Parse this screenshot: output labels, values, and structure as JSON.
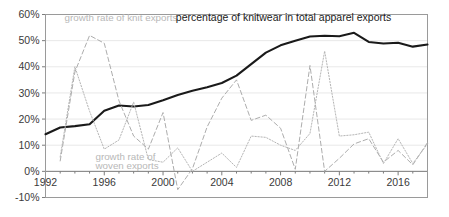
{
  "chart_data": {
    "type": "line",
    "title": "percentage of knitwear in total apparel exports",
    "xlabel": "",
    "ylabel": "",
    "xlim": [
      1992,
      2018
    ],
    "ylim": [
      -10,
      60
    ],
    "grid": true,
    "legend": "inline-annotations",
    "y_ticks": [
      "-10%",
      "0%",
      "10%",
      "20%",
      "30%",
      "40%",
      "50%",
      "60%"
    ],
    "y_tick_values": [
      -10,
      0,
      10,
      20,
      30,
      40,
      50,
      60
    ],
    "x_ticks": [
      "1992",
      "1996",
      "2000",
      "2004",
      "2008",
      "2012",
      "2016"
    ],
    "x_tick_values": [
      1992,
      1996,
      2000,
      2004,
      2008,
      2012,
      2016
    ],
    "x": [
      1992,
      1993,
      1994,
      1995,
      1996,
      1997,
      1998,
      1999,
      2000,
      2001,
      2002,
      2003,
      2004,
      2005,
      2006,
      2007,
      2008,
      2009,
      2010,
      2011,
      2012,
      2013,
      2014,
      2015,
      2016,
      2017,
      2018
    ],
    "series": [
      {
        "name": "percentage of knitwear in total apparel exports",
        "style": "solid",
        "color": "#1a1a1a",
        "values": [
          14.2,
          16.8,
          17.3,
          18.0,
          23.2,
          25.2,
          24.8,
          25.4,
          27.2,
          29.2,
          30.8,
          32.2,
          33.8,
          36.6,
          41.0,
          45.4,
          48.2,
          50.0,
          51.6,
          51.9,
          51.7,
          53.0,
          49.5,
          48.9,
          49.2,
          47.7,
          48.5
        ]
      },
      {
        "name": "growth rate of knit exports",
        "style": "dashed",
        "color": "#adadad",
        "values": [
          null,
          4.0,
          38.0,
          52.0,
          49.0,
          27.0,
          13.5,
          8.5,
          22.5,
          -7.0,
          1.0,
          17.0,
          28.0,
          35.0,
          19.5,
          21.5,
          16.5,
          0.8,
          40.5,
          0.0,
          5.0,
          10.5,
          12.5,
          3.5,
          8.0,
          2.5,
          11.0
        ]
      },
      {
        "name": "growth rate of woven exports",
        "style": "dotted",
        "color": "#b5b5b5",
        "values": [
          null,
          5.5,
          40.0,
          23.0,
          8.5,
          12.0,
          26.5,
          4.5,
          3.5,
          9.0,
          0.0,
          3.5,
          7.0,
          1.5,
          13.5,
          13.0,
          10.0,
          8.0,
          14.5,
          46.0,
          13.5,
          14.0,
          15.0,
          3.0,
          12.5,
          3.0,
          10.5
        ]
      }
    ],
    "annotations": [
      {
        "id": "knit-annotation",
        "text": "growth rate of knit exports",
        "x_axis": 1993.3,
        "y_axis": 57.5
      },
      {
        "id": "woven-annotation-line1",
        "text": "growth rate of",
        "x_axis": 1995.4,
        "y_axis": 4.3
      },
      {
        "id": "woven-annotation-line2",
        "text": "woven exports",
        "x_axis": 1995.4,
        "y_axis": 1.0
      },
      {
        "id": "chart-title-annotation",
        "text": "percentage of knitwear in total apparel exports",
        "x_axis": 2008.2,
        "y_axis": 57.5
      }
    ]
  },
  "colors": {
    "primary_series": "#1a1a1a",
    "knit_series": "#adadad",
    "woven_series": "#b5b5b5",
    "gridline": "#e2e2e2",
    "axis": "#7d7d7d",
    "background": "#ffffff",
    "tick_label": "#3a3a3a"
  }
}
